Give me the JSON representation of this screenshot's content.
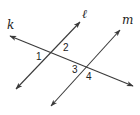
{
  "diagram": {
    "lines": [
      {
        "name": "k",
        "label": "k",
        "x1": 10,
        "y1": 36,
        "x2": 133,
        "y2": 86,
        "label_x": 7,
        "label_y": 29
      },
      {
        "name": "l",
        "label": "ℓ",
        "x1": 16,
        "y1": 89,
        "x2": 80,
        "y2": 22,
        "label_x": 82,
        "label_y": 18
      },
      {
        "name": "m",
        "label": "m",
        "x1": 51,
        "y1": 106,
        "x2": 120,
        "y2": 30,
        "label_x": 122,
        "label_y": 24
      }
    ],
    "angles": [
      {
        "label": "1",
        "x": 36,
        "y": 60
      },
      {
        "label": "2",
        "x": 63,
        "y": 51
      },
      {
        "label": "3",
        "x": 72,
        "y": 73
      },
      {
        "label": "4",
        "x": 86,
        "y": 80
      }
    ],
    "colors": {
      "stroke": "#3a3a3a",
      "text": "#222222",
      "background": "#ffffff"
    }
  }
}
